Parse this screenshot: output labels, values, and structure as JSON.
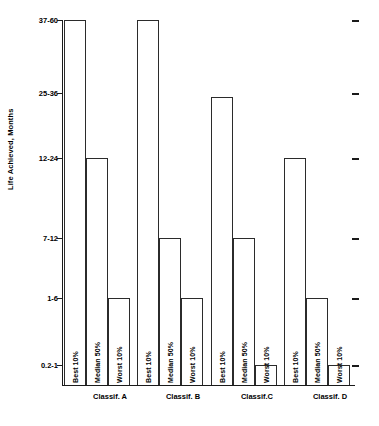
{
  "chart_data": {
    "type": "bar",
    "title": "",
    "xlabel": "",
    "ylabel": "Life Achieved, Months",
    "orientation": "vertical",
    "grid": false,
    "legend_position": "none",
    "axis_kind": "ordinal",
    "y_categories": [
      "37-60",
      "25-36",
      "12-24",
      "7-12",
      "1-6",
      "0.2-1"
    ],
    "y_axis_order": "top-to-bottom",
    "categories": [
      "Classif. A",
      "Classif. B",
      "Classif.C",
      "Classif. D"
    ],
    "series_names": [
      "Best 10%",
      "Median 50%",
      "Worst 10%"
    ],
    "series": [
      {
        "name": "Best 10%",
        "values": [
          "37-60",
          "37-60",
          "25-36",
          "12-24"
        ]
      },
      {
        "name": "Median 50%",
        "values": [
          "12-24",
          "7-12",
          "7-12",
          "1-6"
        ]
      },
      {
        "name": "Worst 10%",
        "values": [
          "1-6",
          "1-6",
          "0.2-1",
          "0.2-1"
        ]
      }
    ],
    "bar_style": "outline",
    "bar_fill": "#ffffff",
    "bar_stroke": "#2b2b2b"
  },
  "axis": {
    "y_title": "Life Achieved, Months",
    "y_ticks": [
      {
        "label": "37-60",
        "y": 20
      },
      {
        "label": "25-36",
        "y": 93
      },
      {
        "label": "12-24",
        "y": 158
      },
      {
        "label": "7-12",
        "y": 238
      },
      {
        "label": "1-6",
        "y": 298
      },
      {
        "label": "0.2-1",
        "y": 365
      }
    ],
    "baseline_y": 385
  },
  "groups": [
    {
      "label": "Classif. A",
      "center_x": 48,
      "bars": [
        {
          "series": "Best 10%",
          "level": "37-60",
          "x": 2,
          "width": 22,
          "top": 20
        },
        {
          "series": "Median 50%",
          "level": "12-24",
          "x": 24,
          "width": 22,
          "top": 158
        },
        {
          "series": "Worst 10%",
          "level": "1-6",
          "x": 46,
          "width": 22,
          "top": 298
        }
      ]
    },
    {
      "label": "Classif. B",
      "center_x": 121,
      "bars": [
        {
          "series": "Best 10%",
          "level": "37-60",
          "x": 75,
          "width": 22,
          "top": 20
        },
        {
          "series": "Median 50%",
          "level": "7-12",
          "x": 97,
          "width": 22,
          "top": 238
        },
        {
          "series": "Worst 10%",
          "level": "1-6",
          "x": 119,
          "width": 22,
          "top": 298
        }
      ]
    },
    {
      "label": "Classif.C",
      "center_x": 195,
      "bars": [
        {
          "series": "Best 10%",
          "level": "25-36",
          "x": 149,
          "width": 22,
          "top": 97
        },
        {
          "series": "Median 50%",
          "level": "7-12",
          "x": 171,
          "width": 22,
          "top": 238
        },
        {
          "series": "Worst 10%",
          "level": "0.2-1",
          "x": 193,
          "width": 22,
          "top": 365
        }
      ]
    },
    {
      "label": "Classif. D",
      "center_x": 268,
      "bars": [
        {
          "series": "Best 10%",
          "level": "12-24",
          "x": 222,
          "width": 22,
          "top": 158
        },
        {
          "series": "Median 50%",
          "level": "1-6",
          "x": 244,
          "width": 22,
          "top": 298
        },
        {
          "series": "Worst 10%",
          "level": "0.2-1",
          "x": 266,
          "width": 22,
          "top": 365
        }
      ]
    }
  ],
  "right_ticks": [
    20,
    93,
    158,
    238,
    298,
    365
  ]
}
